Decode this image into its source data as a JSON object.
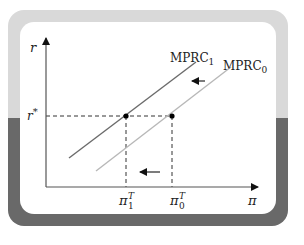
{
  "diagram": {
    "type": "economics-shift-diagram",
    "axes": {
      "y_label": "r",
      "x_label": "π"
    },
    "equilibrium_rate": {
      "label": "r",
      "superscript": "*"
    },
    "curves": [
      {
        "id": "mprc1",
        "label": "MPRC",
        "subscript": "1",
        "color": "#6b6b6b"
      },
      {
        "id": "mprc0",
        "label": "MPRC",
        "subscript": "0",
        "color": "#b8b8b8"
      }
    ],
    "x_markers": [
      {
        "id": "pi1",
        "label": "π",
        "superscript": "T",
        "subscript": "1"
      },
      {
        "id": "pi0",
        "label": "π",
        "superscript": "T",
        "subscript": "0"
      }
    ],
    "arrows": [
      {
        "id": "curve-shift-arrow",
        "direction": "left"
      },
      {
        "id": "target-shift-arrow",
        "direction": "left"
      }
    ],
    "colors": {
      "frame_top": "#d9d9d9",
      "frame_bottom": "#696969",
      "panel": "#ffffff",
      "axis": "#555555",
      "dashed": "#333333"
    }
  }
}
